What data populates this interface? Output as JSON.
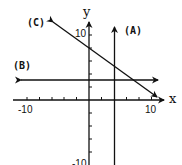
{
  "figure": {
    "type": "coordinate-plane",
    "axes": {
      "x_label": "x",
      "y_label": "y",
      "x_tick_labels": [
        "-10",
        "10"
      ],
      "y_tick_labels": [
        "10",
        "-10"
      ],
      "tick_spacing": 2
    },
    "lines": [
      {
        "id": "A",
        "label": "(A)",
        "kind": "vertical",
        "equation": "x = 4"
      },
      {
        "id": "B",
        "label": "(B)",
        "kind": "horizontal",
        "equation": "y = 3"
      },
      {
        "id": "C",
        "label": "(C)",
        "kind": "slanted",
        "equation": "y = -0.8x + 8"
      }
    ],
    "stroke_color": "#111111",
    "background": "#ffffff"
  }
}
